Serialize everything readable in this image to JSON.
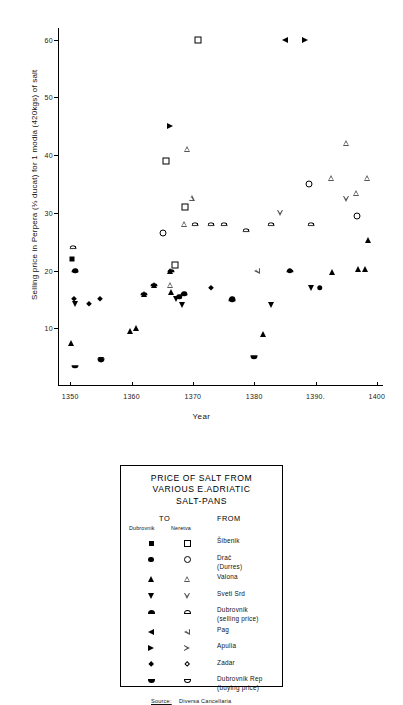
{
  "chart_data": {
    "type": "scatter",
    "title": "",
    "xlabel": "Year",
    "ylabel": "Selling price in Perpera (⅓ ducat) for 1 modia (420kgs) of salt",
    "xlim": [
      1348,
      1401
    ],
    "ylim": [
      0,
      62
    ],
    "xticks": [
      1350,
      1360,
      1370,
      1380,
      1390,
      1400
    ],
    "yticks": [
      10,
      20,
      30,
      40,
      50,
      60
    ],
    "xtick_labels": [
      "1350",
      "1360",
      "1370",
      "1380",
      "1390.",
      "1400"
    ],
    "ytick_labels": [
      "10",
      "20",
      "30",
      "40",
      "50",
      "60"
    ],
    "grid": false,
    "legend_position": "below-plot",
    "series": [
      {
        "name": "Šibenik — to Dubrovnik",
        "marker": "square-f",
        "points": [
          [
            1350.3,
            22.0
          ]
        ]
      },
      {
        "name": "Šibenik — to Neretva",
        "marker": "square-o",
        "points": [
          [
            1365.6,
            39.0
          ],
          [
            1367.0,
            21.0
          ],
          [
            1368.7,
            31.0
          ],
          [
            1370.8,
            60.0
          ]
        ]
      },
      {
        "name": "Drač (Durres) — to Dubrovnik",
        "marker": "circle-f",
        "points": [
          [
            1350.8,
            20.0
          ],
          [
            1367.8,
            15.5
          ],
          [
            1368.6,
            16.0
          ],
          [
            1376.4,
            15.0
          ],
          [
            1385.8,
            20.0
          ],
          [
            1390.7,
            17.0
          ]
        ]
      },
      {
        "name": "Drač (Durres) — to Neretva",
        "marker": "circle-o",
        "points": [
          [
            1365.2,
            26.5
          ],
          [
            1389.0,
            35.0
          ],
          [
            1396.8,
            29.5
          ]
        ]
      },
      {
        "name": "Valona — to Dubrovnik",
        "marker": "tri-up-f",
        "points": [
          [
            1350.2,
            7.5
          ],
          [
            1359.8,
            9.5
          ],
          [
            1360.8,
            10.0
          ],
          [
            1362.0,
            16.0
          ],
          [
            1363.7,
            17.5
          ],
          [
            1366.3,
            20.0
          ],
          [
            1366.5,
            16.3
          ],
          [
            1381.5,
            9.0
          ],
          [
            1392.7,
            19.8
          ],
          [
            1397.0,
            20.2
          ],
          [
            1398.0,
            20.2
          ],
          [
            1398.6,
            25.2
          ]
        ]
      },
      {
        "name": "Valona — to Neretva",
        "marker": "tri-up-o",
        "points": [
          [
            1366.3,
            17.5
          ],
          [
            1368.5,
            28.0
          ],
          [
            1369.0,
            41.0
          ],
          [
            1369.8,
            32.5
          ],
          [
            1392.6,
            36.0
          ],
          [
            1395.0,
            42.0
          ],
          [
            1396.6,
            33.5
          ],
          [
            1398.4,
            36.0
          ]
        ]
      },
      {
        "name": "Sveti Srd — to Dubrovnik",
        "marker": "tri-dn-f",
        "points": [
          [
            1350.7,
            14.2
          ],
          [
            1355.0,
            4.5
          ],
          [
            1367.2,
            15.0
          ],
          [
            1368.3,
            14.0
          ],
          [
            1382.8,
            14.0
          ],
          [
            1389.2,
            17.0
          ]
        ]
      },
      {
        "name": "Sveti Srd — to Neretva",
        "marker": "tri-dn-o",
        "points": [
          [
            1384.2,
            30.0
          ],
          [
            1395.0,
            32.3
          ]
        ]
      },
      {
        "name": "Dubrovnik (selling price) — to Dubrovnik",
        "marker": "semi-up-f",
        "points": [
          [
            1350.8,
            20.0
          ],
          [
            1362.0,
            16.0
          ],
          [
            1363.7,
            17.5
          ],
          [
            1366.4,
            20.0
          ],
          [
            1368.6,
            16.0
          ],
          [
            1376.4,
            15.0
          ],
          [
            1385.8,
            20.0
          ]
        ]
      },
      {
        "name": "Dubrovnik (selling price) — to Neretva",
        "marker": "semi-up-o",
        "points": [
          [
            1350.4,
            24.0
          ],
          [
            1370.3,
            28.0
          ],
          [
            1372.9,
            28.0
          ],
          [
            1375.0,
            28.0
          ],
          [
            1378.6,
            27.0
          ],
          [
            1382.8,
            28.0
          ],
          [
            1389.3,
            28.0
          ]
        ]
      },
      {
        "name": "Pag — to Dubrovnik",
        "marker": "tri-lf-f",
        "points": [
          [
            1385.0,
            60.0
          ]
        ]
      },
      {
        "name": "Pag — to Neretva",
        "marker": "tri-lf-o",
        "points": [
          [
            1380.4,
            20.0
          ]
        ]
      },
      {
        "name": "Apulia — to Dubrovnik",
        "marker": "tri-rt-f",
        "points": [
          [
            1366.2,
            45.0
          ],
          [
            1388.2,
            60.0
          ]
        ]
      },
      {
        "name": "Apulia — to Neretva",
        "marker": "tri-rt-o",
        "points": []
      },
      {
        "name": "Zadar — to Dubrovnik",
        "marker": "diam-f",
        "points": [
          [
            1350.6,
            15.0
          ],
          [
            1353.0,
            14.2
          ],
          [
            1354.8,
            15.0
          ],
          [
            1372.9,
            17.0
          ]
        ]
      },
      {
        "name": "Zadar — to Neretva",
        "marker": "diam-o",
        "points": []
      },
      {
        "name": "Dubrovnik Rep (buying price) — to Dubrovnik",
        "marker": "semi-dn-f",
        "points": [
          [
            1350.8,
            3.3
          ],
          [
            1355.0,
            4.5
          ],
          [
            1380.0,
            5.0
          ]
        ]
      },
      {
        "name": "Dubrovnik Rep (buying price) — to Neretva",
        "marker": "semi-dn-o",
        "points": []
      }
    ]
  },
  "legend": {
    "title_lines": [
      "PRICE OF SALT FROM",
      "VARIOUS  E.ADRIATIC",
      "SALT-PANS"
    ],
    "col_to": "TO",
    "col_from": "FROM",
    "sub_dubrovnik": "Dubrovnik",
    "sub_neretva": "Neretva",
    "rows": [
      {
        "marker_filled": "square-f",
        "marker_open": "square-o",
        "label": "Šibenik"
      },
      {
        "marker_filled": "circle-f",
        "marker_open": "circle-o",
        "label": "Drač\n(Durres)"
      },
      {
        "marker_filled": "tri-up-f",
        "marker_open": "tri-up-o",
        "label": "Valona"
      },
      {
        "marker_filled": "tri-dn-f",
        "marker_open": "tri-dn-o",
        "label": "Sveti  Srd"
      },
      {
        "marker_filled": "semi-up-f",
        "marker_open": "semi-up-o",
        "label": "Dubrovnik\n(selling price)"
      },
      {
        "marker_filled": "tri-lf-f",
        "marker_open": "tri-lf-o",
        "label": "Pag"
      },
      {
        "marker_filled": "tri-rt-f",
        "marker_open": "tri-rt-o",
        "label": "Apulia"
      },
      {
        "marker_filled": "diam-f",
        "marker_open": "diam-o",
        "label": "Zadar"
      },
      {
        "marker_filled": "semi-dn-f",
        "marker_open": "semi-dn-o",
        "label": "Dubrovnik Rep\n(buying price)"
      }
    ],
    "source_label": "Source:",
    "source_text": "Diversa Cancellaria",
    "source_years": "1350-1400"
  }
}
